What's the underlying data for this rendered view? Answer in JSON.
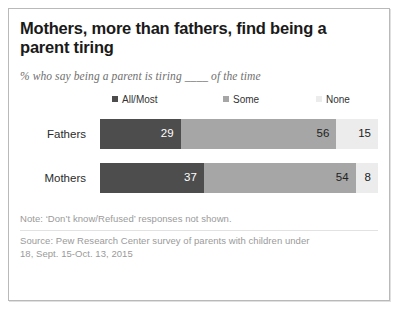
{
  "card": {
    "title": "Mothers, more than fathers, find being a parent tiring",
    "subtitle": "% who say being a parent is tiring ____ of the time"
  },
  "legend": {
    "items": [
      {
        "label": "All/Most",
        "color": "#4d4d4d"
      },
      {
        "label": "Some",
        "color": "#a6a6a6"
      },
      {
        "label": "None",
        "color": "#ececec"
      }
    ]
  },
  "notes": {
    "note": "Note: ‘Don’t know/Refused’ responses not shown.",
    "source_line_1": "Source: Pew Research Center survey of parents with children under",
    "source_line_2": "18, Sept. 15-Oct. 13, 2015"
  },
  "chart_data": {
    "type": "bar",
    "orientation": "horizontal",
    "stacked": true,
    "stack_total": 100,
    "title": "Mothers, more than fathers, find being a parent tiring",
    "subtitle": "% who say being a parent is tiring ____ of the time",
    "xlabel": "",
    "ylabel": "",
    "xlim": [
      0,
      100
    ],
    "grid": false,
    "legend_position": "top",
    "categories": [
      "Fathers",
      "Mothers"
    ],
    "series": [
      {
        "name": "All/Most",
        "color": "#4d4d4d",
        "values": [
          29,
          37
        ]
      },
      {
        "name": "Some",
        "color": "#a6a6a6",
        "values": [
          56,
          54
        ]
      },
      {
        "name": "None",
        "color": "#ececec",
        "values": [
          15,
          8
        ]
      }
    ],
    "rows": [
      {
        "label": "Fathers",
        "segments": [
          {
            "name": "All/Most",
            "value": 29,
            "display": "29",
            "color": "#4d4d4d"
          },
          {
            "name": "Some",
            "value": 56,
            "display": "56",
            "color": "#a6a6a6"
          },
          {
            "name": "None",
            "value": 15,
            "display": "15",
            "color": "#ececec"
          }
        ]
      },
      {
        "label": "Mothers",
        "segments": [
          {
            "name": "All/Most",
            "value": 37,
            "display": "37",
            "color": "#4d4d4d"
          },
          {
            "name": "Some",
            "value": 54,
            "display": "54",
            "color": "#a6a6a6"
          },
          {
            "name": "None",
            "value": 8,
            "display": "8",
            "color": "#ececec"
          }
        ]
      }
    ],
    "annotations": [
      "Note: ‘Don’t know/Refused’ responses not shown.",
      "Source: Pew Research Center survey of parents with children under 18, Sept. 15-Oct. 13, 2015"
    ]
  }
}
